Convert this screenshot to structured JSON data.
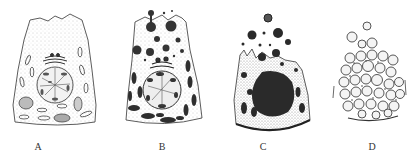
{
  "figure": {
    "panels": [
      {
        "id": "A",
        "label": "A",
        "description": "Resting glandular cell with nucleus, Golgi apparatus and mitochondria"
      },
      {
        "id": "B",
        "label": "B",
        "description": "Cell accumulating secretory granules, beginning apical release"
      },
      {
        "id": "C",
        "label": "C",
        "description": "Cell with dense granules being extruded from apical surface"
      },
      {
        "id": "D",
        "label": "D",
        "description": "Cell filled with spherical secretory vesicles, disintegrating"
      }
    ],
    "colors": {
      "ink": "#2a2a2a",
      "stipple": "#9a9a9a",
      "background": "#ffffff"
    }
  }
}
